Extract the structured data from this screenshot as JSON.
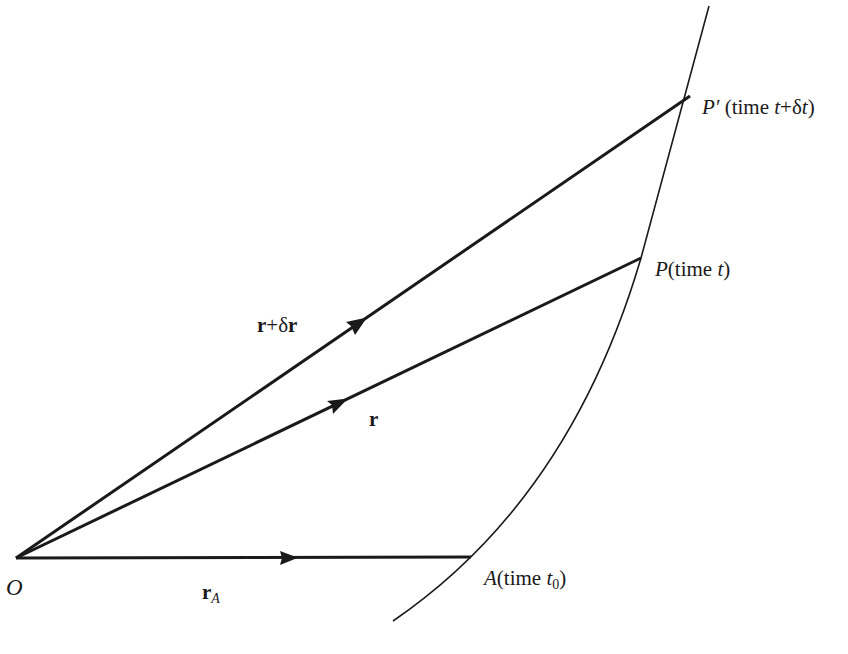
{
  "figure": {
    "type": "kinematics-position-vector-diagram",
    "colors": {
      "ink": "#1a1a1a",
      "background": "#ffffff"
    },
    "points": {
      "origin": {
        "name": "O",
        "x": 16,
        "y": 558
      },
      "A": {
        "name": "A",
        "time_prefix": "(time ",
        "time_var": "t",
        "time_sub": "0",
        "time_suffix": ")",
        "x": 471,
        "y": 557
      },
      "P": {
        "name": "P",
        "time_prefix": "(time ",
        "time_var": "t",
        "time_suffix": ")",
        "x": 641,
        "y": 258
      },
      "P_prime": {
        "name": "P′",
        "time_prefix": " (time ",
        "time_var1": "t",
        "plus": "+δ",
        "time_var2": "t",
        "time_suffix": ")",
        "x": 690,
        "y": 96
      }
    },
    "vectors": [
      {
        "id": "rA",
        "label_bold": "r",
        "label_sub": "A",
        "from": "origin",
        "to": "A"
      },
      {
        "id": "r",
        "label_bold": "r",
        "from": "origin",
        "to": "P"
      },
      {
        "id": "r_plus_dr",
        "label_bold1": "r",
        "label_mid": "+δ",
        "label_bold2": "r",
        "from": "origin",
        "to": "P_prime"
      }
    ],
    "curve": {
      "description": "trajectory path",
      "start": [
        393,
        621
      ],
      "end": [
        709,
        6
      ]
    }
  }
}
